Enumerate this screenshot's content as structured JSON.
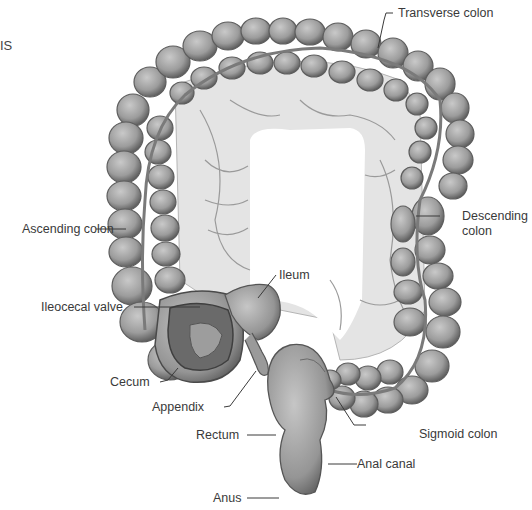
{
  "diagram": {
    "cropped_title_fragment": "IS",
    "labels": [
      {
        "id": "transverse-colon",
        "text": "Transverse colon"
      },
      {
        "id": "ascending-colon",
        "text": "Ascending colon"
      },
      {
        "id": "descending-colon-line1",
        "text": "Descending"
      },
      {
        "id": "descending-colon-line2",
        "text": "colon"
      },
      {
        "id": "ileum",
        "text": "Ileum"
      },
      {
        "id": "ileocecal-valve",
        "text": "Ileocecal valve"
      },
      {
        "id": "cecum",
        "text": "Cecum"
      },
      {
        "id": "appendix",
        "text": "Appendix"
      },
      {
        "id": "rectum",
        "text": "Rectum"
      },
      {
        "id": "sigmoid-colon",
        "text": "Sigmoid colon"
      },
      {
        "id": "anal-canal",
        "text": "Anal canal"
      },
      {
        "id": "anus",
        "text": "Anus"
      }
    ],
    "colors": {
      "organ_fill": "#9a9a9a",
      "organ_light": "#c4c4c4",
      "organ_dark": "#5a5a5a",
      "mesentery": "#e2e2e2",
      "vessel": "#8a8a8a",
      "label_text": "#3a3a3a",
      "leader_line": "#3a3a3a"
    }
  }
}
